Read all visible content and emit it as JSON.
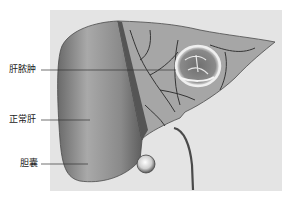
{
  "figure": {
    "labels": [
      {
        "id": "abscess",
        "text": "肝脓肿"
      },
      {
        "id": "normal_liver",
        "text": "正常肝"
      },
      {
        "id": "gallbladder",
        "text": "胆囊"
      }
    ],
    "colors": {
      "panel_background": "#e4e4e4",
      "liver_surface": "#8e8e8e",
      "liver_cut_surface": "#a8a8a8",
      "vessels": "#3a3a3a",
      "abscess_ring": "#f2f2f2",
      "label_text": "#222222",
      "leader_lines": "#333333"
    }
  }
}
